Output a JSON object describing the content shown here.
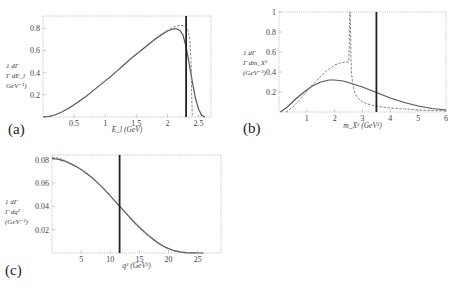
{
  "chart_data": [
    {
      "id": "a",
      "type": "line",
      "panel_label": "(a)",
      "xlabel": "E_l (GeV)",
      "ylabel_lines": [
        "1  dΓ",
        "Γ dE_l",
        "GeV⁻¹)"
      ],
      "xlim": [
        0,
        2.7
      ],
      "ylim": [
        0,
        0.91
      ],
      "xticks": [
        0.5,
        1,
        1.5,
        2,
        2.5
      ],
      "xtick_labels": [
        "0.5",
        "1",
        "1.5",
        "2",
        "2.5"
      ],
      "yticks": [
        0.2,
        0.4,
        0.6,
        0.8
      ],
      "ytick_labels": [
        "0.2",
        "0.4",
        "0.6",
        "0.8"
      ],
      "vertical_line_x": 2.3,
      "series": [
        {
          "name": "solid",
          "style": "solid",
          "x": [
            0,
            0.1,
            0.2,
            0.3,
            0.4,
            0.5,
            0.6,
            0.7,
            0.8,
            0.9,
            1.0,
            1.1,
            1.2,
            1.3,
            1.4,
            1.5,
            1.6,
            1.7,
            1.8,
            1.9,
            2.0,
            2.1,
            2.15,
            2.2,
            2.25,
            2.3,
            2.35,
            2.4,
            2.45,
            2.5,
            2.55,
            2.6
          ],
          "y": [
            0,
            0.005,
            0.02,
            0.045,
            0.075,
            0.11,
            0.15,
            0.19,
            0.235,
            0.28,
            0.325,
            0.37,
            0.42,
            0.47,
            0.52,
            0.565,
            0.61,
            0.655,
            0.7,
            0.74,
            0.775,
            0.795,
            0.795,
            0.78,
            0.74,
            0.63,
            0.48,
            0.32,
            0.17,
            0.07,
            0.015,
            0
          ]
        },
        {
          "name": "dashed",
          "style": "dashed",
          "x": [
            0,
            0.1,
            0.2,
            0.3,
            0.4,
            0.5,
            0.6,
            0.7,
            0.8,
            0.9,
            1.0,
            1.1,
            1.2,
            1.3,
            1.4,
            1.5,
            1.6,
            1.7,
            1.8,
            1.9,
            2.0,
            2.1,
            2.2,
            2.25,
            2.3,
            2.33,
            2.36,
            2.38,
            2.39,
            2.4
          ],
          "y": [
            0,
            0.005,
            0.02,
            0.045,
            0.075,
            0.11,
            0.15,
            0.19,
            0.235,
            0.28,
            0.325,
            0.37,
            0.42,
            0.47,
            0.52,
            0.565,
            0.615,
            0.66,
            0.705,
            0.745,
            0.78,
            0.81,
            0.825,
            0.825,
            0.81,
            0.78,
            0.7,
            0.5,
            0.2,
            0
          ]
        }
      ]
    },
    {
      "id": "b",
      "type": "line",
      "panel_label": "(b)",
      "xlabel": "m_X² (GeV²)",
      "ylabel_lines": [
        "1  dΓ",
        "Γ dm_X²",
        "(GeV⁻²)"
      ],
      "xlim": [
        0,
        6
      ],
      "ylim": [
        0,
        1
      ],
      "xticks": [
        1,
        2,
        3,
        4,
        5,
        6
      ],
      "xtick_labels": [
        "1",
        "2",
        "3",
        "4",
        "5",
        "6"
      ],
      "yticks": [
        0.2,
        0.4,
        0.6,
        0.8,
        1
      ],
      "ytick_labels": [
        "0.2",
        "0.4",
        "0.6",
        "0.8",
        "1"
      ],
      "vertical_line_x": 3.5,
      "series": [
        {
          "name": "solid",
          "style": "solid",
          "x": [
            0.05,
            0.3,
            0.6,
            0.9,
            1.2,
            1.5,
            1.8,
            2.0,
            2.3,
            2.6,
            3.0,
            3.5,
            4.0,
            4.5,
            5.0,
            5.5,
            6.0
          ],
          "y": [
            0,
            0.05,
            0.13,
            0.2,
            0.26,
            0.3,
            0.32,
            0.32,
            0.31,
            0.285,
            0.25,
            0.195,
            0.14,
            0.095,
            0.06,
            0.035,
            0.02
          ]
        },
        {
          "name": "dashed",
          "style": "dashed",
          "x": [
            0.25,
            0.5,
            0.8,
            1.1,
            1.4,
            1.7,
            2.0,
            2.2,
            2.4,
            2.5,
            2.52,
            2.54,
            2.56,
            2.58,
            2.6,
            2.65,
            2.7,
            2.8,
            3.0,
            3.3,
            3.6,
            4.0,
            4.5,
            5.0,
            5.5,
            6.0
          ],
          "y": [
            0,
            0.05,
            0.14,
            0.24,
            0.33,
            0.41,
            0.47,
            0.49,
            0.5,
            0.5,
            0.6,
            1.0,
            1.0,
            0.6,
            0.4,
            0.28,
            0.21,
            0.15,
            0.1,
            0.07,
            0.055,
            0.04,
            0.03,
            0.02,
            0.015,
            0.01
          ]
        }
      ]
    },
    {
      "id": "c",
      "type": "line",
      "panel_label": "(c)",
      "xlabel": "q² (GeV²)",
      "ylabel_lines": [
        "1  dΓ",
        "Γ dq²",
        "(GeV⁻²)"
      ],
      "xlim": [
        0,
        29
      ],
      "ylim": [
        0,
        0.084
      ],
      "xticks": [
        5,
        10,
        15,
        20,
        25
      ],
      "xtick_labels": [
        "5",
        "10",
        "15",
        "20",
        "25"
      ],
      "yticks": [
        0.02,
        0.04,
        0.06,
        0.08
      ],
      "ytick_labels": [
        "0.02",
        "0.04",
        "0.06",
        "0.08"
      ],
      "vertical_line_x": 11.6,
      "series": [
        {
          "name": "solid",
          "style": "solid",
          "x": [
            0,
            1,
            2,
            3,
            4,
            5,
            6,
            7,
            8,
            9,
            10,
            11,
            12,
            13,
            14,
            15,
            16,
            17,
            18,
            19,
            20,
            21,
            22,
            23,
            24,
            25,
            26
          ],
          "y": [
            0.081,
            0.0805,
            0.079,
            0.077,
            0.0745,
            0.0715,
            0.068,
            0.064,
            0.0595,
            0.0545,
            0.049,
            0.0435,
            0.038,
            0.0325,
            0.027,
            0.022,
            0.0175,
            0.0132,
            0.0095,
            0.0063,
            0.0038,
            0.002,
            0.0009,
            0.0003,
            0.0001,
            0.0,
            0.0
          ]
        },
        {
          "name": "dashed",
          "style": "dashed",
          "x": [
            0,
            1,
            2,
            3,
            4,
            5,
            6,
            7,
            8,
            9,
            10,
            11,
            12,
            13,
            14,
            15,
            16,
            17,
            18,
            19,
            20,
            21,
            22,
            23,
            24,
            25
          ],
          "y": [
            0.082,
            0.0815,
            0.0798,
            0.0775,
            0.0748,
            0.0716,
            0.068,
            0.0638,
            0.0592,
            0.0541,
            0.0487,
            0.0432,
            0.0376,
            0.032,
            0.0265,
            0.0214,
            0.0168,
            0.0125,
            0.0088,
            0.0057,
            0.0033,
            0.0016,
            0.0006,
            0.0002,
            0.0,
            0.0
          ]
        }
      ]
    }
  ]
}
